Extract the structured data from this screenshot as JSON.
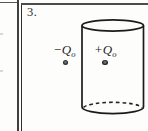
{
  "page": {
    "background_color": "#fdfdfc",
    "rule_line_color": "#3e3e3e",
    "figure_stroke_color": "#1b1b1b"
  },
  "problem": {
    "number_label": "3."
  },
  "charges": {
    "negative": {
      "symbol": "−Q",
      "subscript": "o",
      "position": "outside cylinder"
    },
    "positive": {
      "symbol": "+Q",
      "subscript": "o",
      "position": "inside cylinder"
    }
  },
  "figure": {
    "kind": "vertical cylinder with hidden bottom edge dashed",
    "dot_color": "#2a2a2a"
  }
}
